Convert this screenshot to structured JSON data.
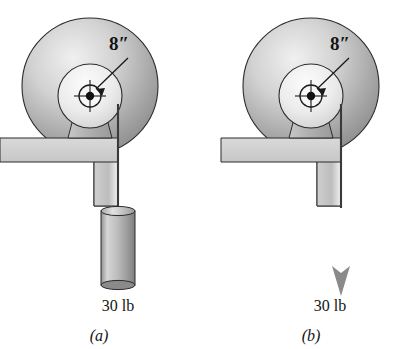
{
  "figure": {
    "background_color": "#ffffff",
    "ink_color": "#1a1a1a",
    "panels": [
      {
        "id": "a",
        "caption": "(a)",
        "dimension_label": "8″",
        "load_label": "30 lb",
        "load_type": "hanging-cylinder-weight",
        "disk": {
          "cx": 90,
          "cy": 86,
          "r": 68,
          "fill_light": "#e9e9e9",
          "fill_dark": "#8d8d8d"
        },
        "hub": {
          "cx": 90,
          "cy": 96,
          "r": 32,
          "fill_light": "#f2f2f2",
          "fill_dark": "#c9c9c9"
        },
        "axle": {
          "cx": 90,
          "cy": 96,
          "r": 11,
          "dot_r": 4
        },
        "support": {
          "x": 0,
          "y": 138,
          "width": 118,
          "height": 24,
          "drop_width": 24,
          "drop_height": 44
        },
        "cord": {
          "x": 118,
          "y_top": 104,
          "y_bottom": 210
        },
        "weight": {
          "x": 71,
          "y": 210,
          "width": 34,
          "height": 76
        }
      },
      {
        "id": "b",
        "caption": "(b)",
        "dimension_label": "8″",
        "load_label": "30 lb",
        "load_type": "downward-force-arrow",
        "disk": {
          "cx": 311,
          "cy": 86,
          "r": 68,
          "fill_light": "#e9e9e9",
          "fill_dark": "#8d8d8d"
        },
        "hub": {
          "cx": 311,
          "cy": 96,
          "r": 32,
          "fill_light": "#f2f2f2",
          "fill_dark": "#c9c9c9"
        },
        "axle": {
          "cx": 311,
          "cy": 96,
          "r": 11,
          "dot_r": 4
        },
        "support": {
          "x": 221,
          "y": 138,
          "width": 120,
          "height": 24,
          "drop_width": 24,
          "drop_height": 44
        },
        "cord": {
          "x": 341,
          "y_top": 104,
          "y_bottom": 208
        },
        "arrow": {
          "x": 348,
          "y_top": 208,
          "y_bottom": 292,
          "color": "#8a8a8a"
        }
      }
    ]
  }
}
